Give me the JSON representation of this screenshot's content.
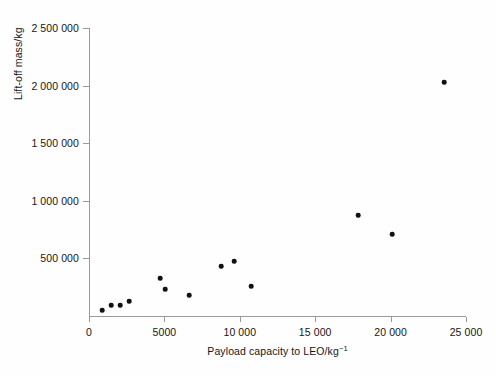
{
  "chart_data": {
    "type": "scatter",
    "title": "",
    "xlabel": "Payload capacity to LEO/kg⁻¹",
    "ylabel": "Lift-off mass/kg",
    "xlim": [
      0,
      25000
    ],
    "ylim": [
      0,
      2500000
    ],
    "grid": false,
    "legend": null,
    "xticks": [
      0,
      5000,
      10000,
      15000,
      20000,
      25000
    ],
    "xtick_labels": [
      "0",
      "5000",
      "10 000",
      "15 000",
      "20 000",
      "25 000"
    ],
    "yticks": [
      0,
      500000,
      1000000,
      1500000,
      2000000,
      2500000
    ],
    "ytick_labels": [
      "",
      "500 000",
      "1 000 000",
      "1 500 000",
      "2 000 000",
      "2 500 000"
    ],
    "marker": "filled-circle",
    "marker_color": "#111111",
    "points": [
      {
        "x": 860,
        "y": 52000
      },
      {
        "x": 1460,
        "y": 95000
      },
      {
        "x": 2060,
        "y": 95000
      },
      {
        "x": 2650,
        "y": 130000
      },
      {
        "x": 4740,
        "y": 330000
      },
      {
        "x": 5070,
        "y": 234000
      },
      {
        "x": 6630,
        "y": 182000
      },
      {
        "x": 8750,
        "y": 434000
      },
      {
        "x": 9610,
        "y": 477000
      },
      {
        "x": 10740,
        "y": 260000
      },
      {
        "x": 17840,
        "y": 876000
      },
      {
        "x": 20100,
        "y": 712000
      },
      {
        "x": 23540,
        "y": 2031000
      }
    ]
  },
  "axes": {
    "x_title_main": "Payload capacity to LEO/kg",
    "x_title_exponent": "−1",
    "y_title": "Lift-off mass/kg"
  }
}
